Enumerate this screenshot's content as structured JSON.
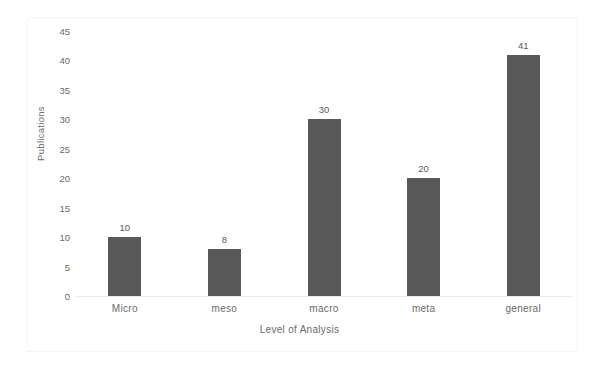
{
  "figure": {
    "top_caption_fragment": "",
    "background_color": "#ffffff",
    "border_color": "#f4f4f5"
  },
  "chart_data": {
    "type": "bar",
    "title": "",
    "subtitle": "",
    "xlabel": "Level of Analysis",
    "ylabel": "Publications",
    "categories": [
      "Micro",
      "meso",
      "macro",
      "meta",
      "general"
    ],
    "values": [
      10,
      8,
      30,
      20,
      41
    ],
    "data_labels": [
      "10",
      "8",
      "30",
      "20",
      "41"
    ],
    "ylim": [
      0,
      45
    ],
    "y_tick_step": 5,
    "y_ticks": [
      0,
      5,
      10,
      15,
      20,
      25,
      30,
      35,
      40,
      45
    ],
    "y_tick_labels": [
      "0",
      "5",
      "10",
      "15",
      "20",
      "25",
      "30",
      "35",
      "40",
      "45"
    ],
    "grid": false,
    "legend": false,
    "legend_position": "none",
    "series": [
      {
        "name": "Publications",
        "values": [
          10,
          8,
          30,
          20,
          41
        ],
        "color": "#595959"
      }
    ],
    "bar_color": "#595959",
    "axis_text_color": "#6a6a6a",
    "baseline_color": "#e9e9ea"
  }
}
